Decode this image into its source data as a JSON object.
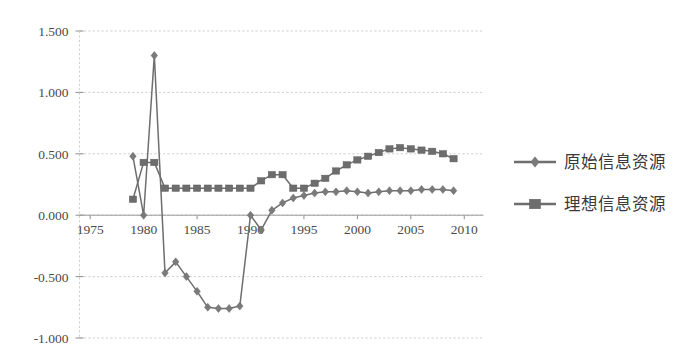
{
  "chart_data": {
    "type": "line",
    "title": "",
    "xlabel": "",
    "ylabel": "",
    "xlim": [
      1974.0,
      2011.8
    ],
    "ylim": [
      -1.0,
      1.5
    ],
    "ytick_labels": [
      "1.500",
      "1.000",
      "0.500",
      "0.000",
      "-0.500",
      "-1.000"
    ],
    "ytick_values": [
      1.5,
      1.0,
      0.5,
      0.0,
      -0.5,
      -1.0
    ],
    "xtick_labels": [
      "1975",
      "1980",
      "1985",
      "1990",
      "1995",
      "2000",
      "2005",
      "2010"
    ],
    "xtick_values": [
      1975,
      1980,
      1985,
      1990,
      1995,
      2000,
      2005,
      2010
    ],
    "grid": true,
    "legend_position": "right",
    "x": [
      1979,
      1980,
      1981,
      1982,
      1983,
      1984,
      1985,
      1986,
      1987,
      1988,
      1989,
      1990,
      1991,
      1992,
      1993,
      1994,
      1995,
      1996,
      1997,
      1998,
      1999,
      2000,
      2001,
      2002,
      2003,
      2004,
      2005,
      2006,
      2007,
      2008,
      2009
    ],
    "series": [
      {
        "name": "原始信息资源",
        "marker": "diamond",
        "color": "#7a7a7a",
        "values": [
          0.48,
          0.0,
          1.3,
          -0.47,
          -0.38,
          -0.5,
          -0.62,
          -0.75,
          -0.76,
          -0.76,
          -0.74,
          0.0,
          -0.12,
          0.04,
          0.1,
          0.14,
          0.16,
          0.18,
          0.19,
          0.19,
          0.2,
          0.19,
          0.18,
          0.19,
          0.2,
          0.2,
          0.2,
          0.21,
          0.21,
          0.21,
          0.2
        ]
      },
      {
        "name": "理想信息资源",
        "marker": "square",
        "color": "#6d6d6d",
        "values": [
          0.13,
          0.43,
          0.43,
          0.22,
          0.22,
          0.22,
          0.22,
          0.22,
          0.22,
          0.22,
          0.22,
          0.22,
          0.28,
          0.33,
          0.33,
          0.22,
          0.22,
          0.26,
          0.3,
          0.36,
          0.41,
          0.45,
          0.48,
          0.51,
          0.54,
          0.55,
          0.54,
          0.53,
          0.52,
          0.5,
          0.46
        ]
      }
    ]
  },
  "legend": {
    "items": [
      {
        "label": "原始信息资源",
        "marker": "diamond"
      },
      {
        "label": "理想信息资源",
        "marker": "square"
      }
    ]
  }
}
